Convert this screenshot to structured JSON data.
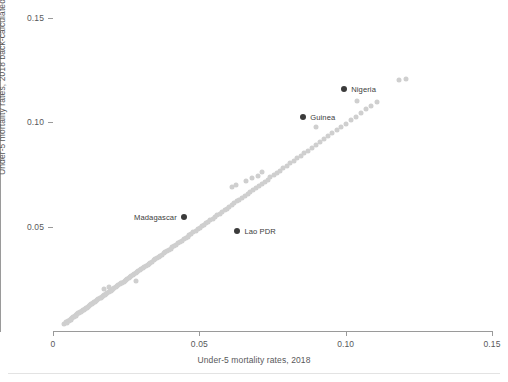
{
  "chart_data": {
    "type": "scatter",
    "title": "",
    "xlabel": "Under-5 mortality rates, 2018",
    "ylabel": "Under-5 mortality rates, 2018 back-calculated",
    "xlim": [
      0,
      0.15
    ],
    "ylim": [
      0,
      0.15
    ],
    "xticks": [
      "0",
      "0.05",
      "0.10",
      "0.15"
    ],
    "xtick_values": [
      0,
      0.05,
      0.1,
      0.15
    ],
    "yticks": [
      "0.05",
      "0.10",
      "0.15"
    ],
    "ytick_values": [
      0.05,
      0.1,
      0.15
    ],
    "grid": false,
    "legend": "none",
    "point_color": "#cfcfcf",
    "highlight_color": "#3b3b3b",
    "axis_color": "#9a9a9a",
    "text_color": "#58585a",
    "series": [
      {
        "name": "countries",
        "points": [
          [
            0.0039,
            0.0034
          ],
          [
            0.0044,
            0.0041
          ],
          [
            0.0047,
            0.0038
          ],
          [
            0.0051,
            0.0047
          ],
          [
            0.0054,
            0.005
          ],
          [
            0.0057,
            0.0052
          ],
          [
            0.006,
            0.0058
          ],
          [
            0.0062,
            0.0055
          ],
          [
            0.0065,
            0.0063
          ],
          [
            0.0068,
            0.0065
          ],
          [
            0.0071,
            0.0068
          ],
          [
            0.0074,
            0.007
          ],
          [
            0.0077,
            0.0076
          ],
          [
            0.008,
            0.0074
          ],
          [
            0.0083,
            0.0081
          ],
          [
            0.0086,
            0.0084
          ],
          [
            0.009,
            0.0087
          ],
          [
            0.0093,
            0.0091
          ],
          [
            0.0096,
            0.0093
          ],
          [
            0.0099,
            0.0097
          ],
          [
            0.0102,
            0.01
          ],
          [
            0.0106,
            0.0103
          ],
          [
            0.0109,
            0.0107
          ],
          [
            0.0112,
            0.011
          ],
          [
            0.0116,
            0.0112
          ],
          [
            0.0119,
            0.0117
          ],
          [
            0.0123,
            0.012
          ],
          [
            0.0126,
            0.0123
          ],
          [
            0.013,
            0.0128
          ],
          [
            0.0133,
            0.013
          ],
          [
            0.0137,
            0.0134
          ],
          [
            0.0141,
            0.0139
          ],
          [
            0.0144,
            0.0141
          ],
          [
            0.0148,
            0.0145
          ],
          [
            0.0152,
            0.015
          ],
          [
            0.0155,
            0.0152
          ],
          [
            0.0159,
            0.0156
          ],
          [
            0.0163,
            0.016
          ],
          [
            0.0167,
            0.0163
          ],
          [
            0.017,
            0.0167
          ],
          [
            0.0174,
            0.0171
          ],
          [
            0.0178,
            0.0174
          ],
          [
            0.0182,
            0.0179
          ],
          [
            0.0186,
            0.0182
          ],
          [
            0.019,
            0.0186
          ],
          [
            0.0194,
            0.0191
          ],
          [
            0.0198,
            0.0194
          ],
          [
            0.0202,
            0.0198
          ],
          [
            0.0175,
            0.02
          ],
          [
            0.019,
            0.021
          ],
          [
            0.0206,
            0.0203
          ],
          [
            0.021,
            0.0207
          ],
          [
            0.0215,
            0.0212
          ],
          [
            0.0219,
            0.0216
          ],
          [
            0.0223,
            0.0219
          ],
          [
            0.0228,
            0.0224
          ],
          [
            0.0232,
            0.0229
          ],
          [
            0.0236,
            0.0232
          ],
          [
            0.0241,
            0.0236
          ],
          [
            0.0245,
            0.0241
          ],
          [
            0.025,
            0.0245
          ],
          [
            0.0254,
            0.025
          ],
          [
            0.0259,
            0.0254
          ],
          [
            0.0264,
            0.0259
          ],
          [
            0.0268,
            0.0263
          ],
          [
            0.0273,
            0.0268
          ],
          [
            0.0278,
            0.0272
          ],
          [
            0.0283,
            0.0278
          ],
          [
            0.0288,
            0.0282
          ],
          [
            0.0292,
            0.0288
          ],
          [
            0.0297,
            0.0292
          ],
          [
            0.0302,
            0.0297
          ],
          [
            0.0285,
            0.024
          ],
          [
            0.0307,
            0.0302
          ],
          [
            0.0312,
            0.0307
          ],
          [
            0.0318,
            0.0312
          ],
          [
            0.0323,
            0.0318
          ],
          [
            0.0328,
            0.0322
          ],
          [
            0.0333,
            0.0328
          ],
          [
            0.0339,
            0.0333
          ],
          [
            0.0344,
            0.0338
          ],
          [
            0.035,
            0.0344
          ],
          [
            0.0355,
            0.0349
          ],
          [
            0.0361,
            0.0355
          ],
          [
            0.0366,
            0.036
          ],
          [
            0.0372,
            0.0366
          ],
          [
            0.0378,
            0.0372
          ],
          [
            0.0384,
            0.0377
          ],
          [
            0.039,
            0.0383
          ],
          [
            0.0396,
            0.0389
          ],
          [
            0.0402,
            0.0395
          ],
          [
            0.0408,
            0.0401
          ],
          [
            0.0414,
            0.0407
          ],
          [
            0.042,
            0.0414
          ],
          [
            0.0427,
            0.042
          ],
          [
            0.0433,
            0.0426
          ],
          [
            0.044,
            0.0433
          ],
          [
            0.0446,
            0.0439
          ],
          [
            0.0453,
            0.0446
          ],
          [
            0.046,
            0.0452
          ],
          [
            0.0466,
            0.0459
          ],
          [
            0.0473,
            0.0466
          ],
          [
            0.048,
            0.0473
          ],
          [
            0.0487,
            0.048
          ],
          [
            0.0494,
            0.0487
          ],
          [
            0.0501,
            0.0494
          ],
          [
            0.0509,
            0.0501
          ],
          [
            0.0516,
            0.0509
          ],
          [
            0.0523,
            0.0516
          ],
          [
            0.0531,
            0.0524
          ],
          [
            0.0538,
            0.0531
          ],
          [
            0.0546,
            0.0539
          ],
          [
            0.0554,
            0.0547
          ],
          [
            0.0562,
            0.0555
          ],
          [
            0.057,
            0.0563
          ],
          [
            0.0578,
            0.0571
          ],
          [
            0.0586,
            0.0579
          ],
          [
            0.0594,
            0.0587
          ],
          [
            0.0603,
            0.0596
          ],
          [
            0.0611,
            0.0604
          ],
          [
            0.062,
            0.0613
          ],
          [
            0.0629,
            0.0622
          ],
          [
            0.0637,
            0.063
          ],
          [
            0.0646,
            0.0639
          ],
          [
            0.0655,
            0.0648
          ],
          [
            0.0665,
            0.0658
          ],
          [
            0.0674,
            0.0667
          ],
          [
            0.0683,
            0.0676
          ],
          [
            0.0693,
            0.0686
          ],
          [
            0.0703,
            0.0696
          ],
          [
            0.0713,
            0.0706
          ],
          [
            0.0723,
            0.0716
          ],
          [
            0.0733,
            0.0726
          ],
          [
            0.0743,
            0.0736
          ],
          [
            0.061,
            0.069
          ],
          [
            0.0625,
            0.07
          ],
          [
            0.066,
            0.072
          ],
          [
            0.068,
            0.0735
          ],
          [
            0.07,
            0.0745
          ],
          [
            0.0715,
            0.0762
          ],
          [
            0.0754,
            0.0747
          ],
          [
            0.0765,
            0.0758
          ],
          [
            0.0776,
            0.0769
          ],
          [
            0.0787,
            0.078
          ],
          [
            0.0798,
            0.0791
          ],
          [
            0.081,
            0.0803
          ],
          [
            0.0822,
            0.0815
          ],
          [
            0.0834,
            0.0827
          ],
          [
            0.0846,
            0.0839
          ],
          [
            0.0859,
            0.0852
          ],
          [
            0.0872,
            0.0865
          ],
          [
            0.0885,
            0.0878
          ],
          [
            0.0898,
            0.0891
          ],
          [
            0.0912,
            0.0905
          ],
          [
            0.0926,
            0.0919
          ],
          [
            0.094,
            0.0933
          ],
          [
            0.0955,
            0.0948
          ],
          [
            0.097,
            0.0963
          ],
          [
            0.0985,
            0.0978
          ],
          [
            0.1001,
            0.0994
          ],
          [
            0.1017,
            0.101
          ],
          [
            0.1034,
            0.1027
          ],
          [
            0.1051,
            0.1044
          ],
          [
            0.1069,
            0.1062
          ],
          [
            0.1087,
            0.108
          ],
          [
            0.1106,
            0.1099
          ],
          [
            0.1181,
            0.1202
          ],
          [
            0.1206,
            0.1207
          ],
          [
            0.09,
            0.098
          ],
          [
            0.104,
            0.11
          ]
        ]
      }
    ],
    "highlights": [
      {
        "name": "Nigeria",
        "x": 0.0995,
        "y": 0.116,
        "label_side": "right"
      },
      {
        "name": "Guinea",
        "x": 0.0855,
        "y": 0.1025,
        "label_side": "right"
      },
      {
        "name": "Madagascar",
        "x": 0.0447,
        "y": 0.0545,
        "label_side": "left"
      },
      {
        "name": "Lao PDR",
        "x": 0.063,
        "y": 0.0478,
        "label_side": "right"
      }
    ]
  }
}
